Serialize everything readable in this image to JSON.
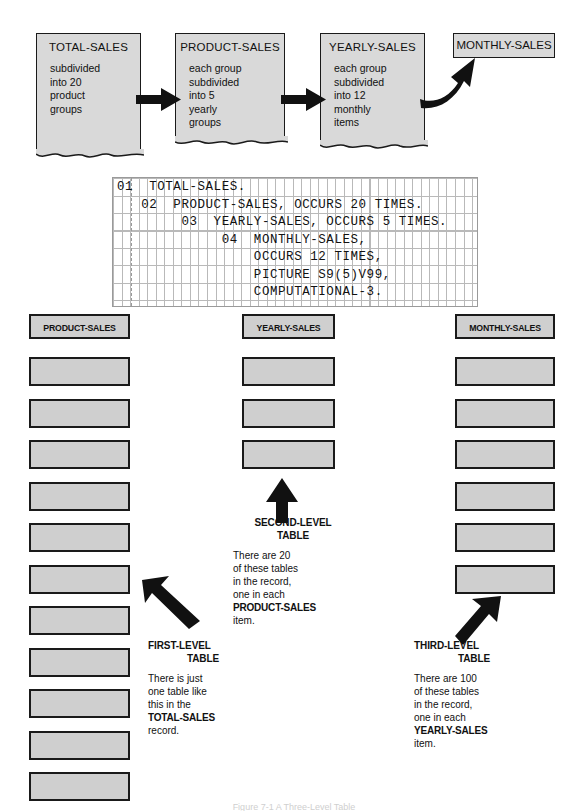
{
  "figure": {
    "caption": "Figure 7-1 A Three-Level Table"
  },
  "flow": {
    "cards": [
      {
        "title": "TOTAL-SALES",
        "lines": [
          "subdivided",
          "into 20",
          "product",
          "groups"
        ]
      },
      {
        "title": "PRODUCT-SALES",
        "lines": [
          "each group",
          "subdivided",
          "into 5",
          "yearly",
          "groups"
        ]
      },
      {
        "title": "YEARLY-SALES",
        "lines": [
          "each group",
          "subdivided",
          "into 12",
          "monthly",
          "items"
        ]
      }
    ],
    "final_label": "MONTHLY-SALES"
  },
  "code": {
    "lines": [
      "01  TOTAL-SALES.",
      "   02  PRODUCT-SALES, OCCURS 20 TIMES.",
      "        03  YEARLY-SALES, OCCURS 5 TIMES.",
      "             04  MONTHLY-SALES,",
      "                 OCCURS 12 TIMES,",
      "                 PICTURE S9(5)V99,",
      "                 COMPUTATIONAL-3."
    ]
  },
  "tables": {
    "first": {
      "header": "PRODUCT-SALES",
      "cell_count": 11,
      "caption_title_line1": "FIRST-LEVEL",
      "caption_title_line2": "TABLE",
      "caption_lines": [
        "There is just",
        "one table like",
        "this in the",
        "TOTAL-SALES",
        "record."
      ]
    },
    "second": {
      "header": "YEARLY-SALES",
      "cell_count": 3,
      "caption_title_line1": "SECOND-LEVEL",
      "caption_title_line2": "TABLE",
      "caption_lines": [
        "There are 20",
        "of these tables",
        "in the record,",
        "one in each",
        "PRODUCT-SALES",
        "item."
      ]
    },
    "third": {
      "header": "MONTHLY-SALES",
      "cell_count": 6,
      "caption_title_line1": "THIRD-LEVEL",
      "caption_title_line2": "TABLE",
      "caption_lines": [
        "There are 100",
        "of these tables",
        "in the record,",
        "one in each",
        "YEARLY-SALES",
        "item."
      ]
    }
  },
  "colors": {
    "card_fill": "#d9d9d9",
    "cell_fill": "#cfcfcf",
    "ink": "#1a1a1a",
    "grid_line": "#b9b9b9"
  }
}
